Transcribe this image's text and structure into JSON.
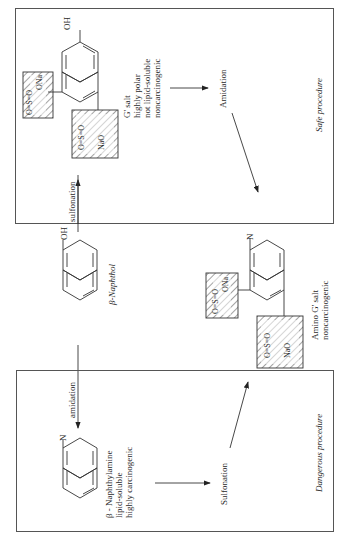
{
  "diagram": {
    "orientation": "rotated-90-ccw",
    "safe_procedure": {
      "label": "Safe procedure",
      "product": {
        "name": "G' salt",
        "properties": [
          "highly polar",
          "not lipid-soluble",
          "noncarcinogenic"
        ],
        "substituents": {
          "top": "OH",
          "sulfonate_1": [
            "ONa",
            "O=S=O"
          ],
          "sulfonate_2": [
            "O",
            "NaO—S",
            "O"
          ]
        }
      },
      "step": "Amidation"
    },
    "start": {
      "name": "β-Naphthol",
      "substituent": "OH"
    },
    "arrows": {
      "up": "sulfonation",
      "down": "amidation"
    },
    "middle_product": {
      "name": "Amino G' salt",
      "properties": [
        "noncarcinogenic"
      ],
      "substituent": "N",
      "sulfonate_1": [
        "ONa",
        "O=S=O"
      ],
      "sulfonate_2": [
        "O",
        "NaO—S",
        "O"
      ]
    },
    "dangerous_procedure": {
      "label": "Dangerous procedure",
      "intermediate": {
        "name": "β - Naphthylamine",
        "properties": [
          "lipid-soluble",
          "highly carcinogenic"
        ],
        "substituent": "N"
      },
      "step": "Sulfonation"
    }
  }
}
